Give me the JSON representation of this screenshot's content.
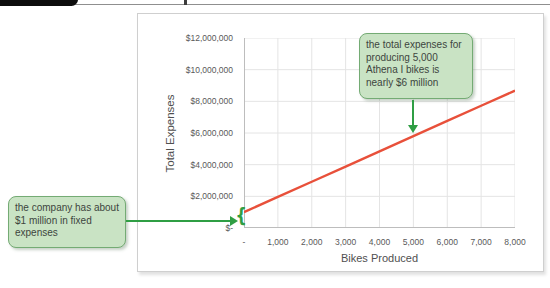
{
  "annotations": {
    "fixed_expenses": {
      "text": "the company has about $1 million in fixed expenses"
    },
    "expenses_at_5000": {
      "text": "the total expenses for producing 5,000 Athena I bikes is nearly $6 million"
    },
    "brace_glyph": "{"
  },
  "chart_data": {
    "type": "line",
    "title": "",
    "xlabel": "Bikes Produced",
    "ylabel": "Total Expenses",
    "x": [
      0,
      1000,
      2000,
      3000,
      4000,
      5000,
      6000,
      7000,
      8000
    ],
    "series": [
      {
        "name": "Total Expenses",
        "color": "#e8503a",
        "values": [
          1000000,
          1960000,
          2920000,
          3880000,
          4840000,
          5800000,
          6760000,
          7720000,
          8680000
        ]
      }
    ],
    "x_tick_labels": [
      "-",
      "1,000",
      "2,000",
      "3,000",
      "4,000",
      "5,000",
      "6,000",
      "7,000",
      "8,000"
    ],
    "y_tick_labels": [
      "$12,000,000",
      "$10,000,000",
      "$8,000,000",
      "$6,000,000",
      "$4,000,000",
      "$2,000,000",
      "$-"
    ],
    "xlim": [
      0,
      8000
    ],
    "ylim": [
      0,
      12000000
    ],
    "grid": true,
    "legend": false
  },
  "colors": {
    "line-red": "#e8503a",
    "callout-fill": "#c9e3c4",
    "callout-border": "#74ab74",
    "arrow-green": "#2f9e44",
    "axis-text": "#595959",
    "grid-gray": "#e4e4e4"
  }
}
